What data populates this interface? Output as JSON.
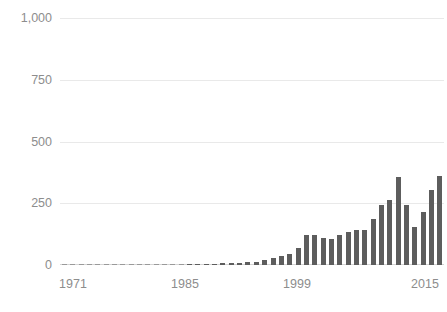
{
  "chart_data": {
    "type": "bar",
    "title": "",
    "subtitle": "",
    "xlabel": "",
    "ylabel": "",
    "ylim": [
      0,
      1000
    ],
    "xlim": [
      1971,
      2016
    ],
    "grid": true,
    "legend": null,
    "legend_position": "none",
    "bar_color": "#5d5d5d",
    "grid_color": "#e9e9e9",
    "axis_text_color": "#8d8d8d",
    "background": "#ffffff",
    "y_ticks": [
      0,
      250,
      500,
      750,
      1000
    ],
    "y_tick_labels": [
      "0",
      "250",
      "500",
      "750",
      "1,000"
    ],
    "x_ticks": [
      1971,
      1985,
      1999,
      2015
    ],
    "x_tick_labels": [
      "1971",
      "1985",
      "1999",
      "2015"
    ],
    "categories": [
      "1971",
      "1972",
      "1973",
      "1974",
      "1975",
      "1976",
      "1977",
      "1978",
      "1979",
      "1980",
      "1981",
      "1982",
      "1983",
      "1984",
      "1985",
      "1986",
      "1987",
      "1988",
      "1989",
      "1990",
      "1991",
      "1992",
      "1993",
      "1994",
      "1995",
      "1996",
      "1997",
      "1998",
      "1999",
      "2000",
      "2001",
      "2002",
      "2003",
      "2004",
      "2005",
      "2006",
      "2007",
      "2008",
      "2009",
      "2010",
      "2011",
      "2012",
      "2013",
      "2014",
      "2015",
      "2016"
    ],
    "values": [
      1,
      1,
      1,
      1,
      1,
      1,
      1,
      1,
      1,
      1,
      1,
      1,
      2,
      2,
      2,
      3,
      4,
      5,
      6,
      7,
      8,
      9,
      12,
      14,
      20,
      28,
      38,
      46,
      70,
      122,
      120,
      110,
      106,
      120,
      132,
      140,
      143,
      187,
      245,
      262,
      355,
      245,
      155,
      215,
      305,
      360
    ]
  }
}
